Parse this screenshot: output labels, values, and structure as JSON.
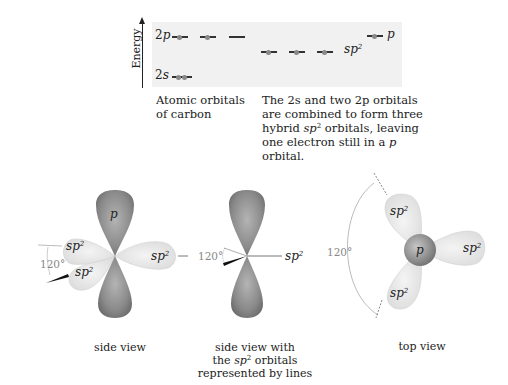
{
  "energy_diagram": {
    "axis_label": "Energy",
    "atomic": {
      "levels": [
        {
          "label_num": "2",
          "label_orb": "p",
          "orbitals": 3,
          "electrons": [
            1,
            1,
            0
          ]
        },
        {
          "label_num": "2",
          "label_orb": "s",
          "orbitals": 1,
          "electrons": [
            2
          ]
        }
      ],
      "caption_line1": "Atomic orbitals",
      "caption_line2": "of carbon"
    },
    "hybrid": {
      "levels": [
        {
          "label": "sp",
          "sup": "2",
          "orbitals": 3,
          "electrons": [
            1,
            1,
            1
          ]
        },
        {
          "label": "p",
          "orbitals": 1,
          "electrons": [
            1
          ]
        }
      ],
      "caption": {
        "l1": "The 2s and two 2p orbitals",
        "l2": "are combined to form three",
        "l3a": "hybrid ",
        "l3b": "sp",
        "l3sup": "2",
        "l3c": " orbitals, leaving",
        "l4a": "one electron still in a ",
        "l4b": "p",
        "l5": "orbital."
      }
    }
  },
  "views": [
    {
      "id": "side-view",
      "caption": "side view",
      "labels": {
        "p": "p",
        "sp": "sp",
        "sup": "2",
        "angle": "120°"
      }
    },
    {
      "id": "side-view-lines",
      "caption_l1": "side view with",
      "caption_l2a": "the ",
      "caption_l2b": "sp",
      "caption_l2sup": "2",
      "caption_l2c": " orbitals",
      "caption_l3": "represented by lines",
      "labels": {
        "sp": "sp",
        "sup": "2",
        "angle": "120°"
      }
    },
    {
      "id": "top-view",
      "caption": "top view",
      "labels": {
        "p": "p",
        "sp": "sp",
        "sup": "2",
        "angle": "120°"
      }
    }
  ],
  "colors": {
    "panel_bg": "#f1f1f1",
    "p_lobe": "#8a8a8a",
    "sp2_lobe": "#e6e6e6",
    "electron": "#888888"
  }
}
